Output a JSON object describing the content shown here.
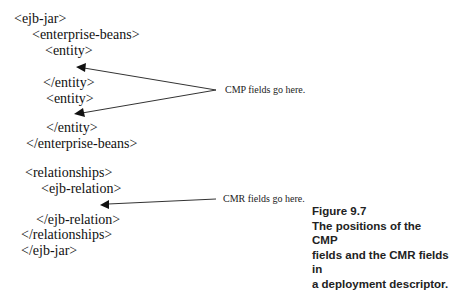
{
  "xml_lines": [
    {
      "text": "<ejb-jar>",
      "x": 14,
      "y": 12
    },
    {
      "text": "<enterprise-beans>",
      "x": 32,
      "y": 28
    },
    {
      "text": "<entity>",
      "x": 45,
      "y": 44
    },
    {
      "text": "</entity>",
      "x": 43,
      "y": 76
    },
    {
      "text": "<entity>",
      "x": 46,
      "y": 92
    },
    {
      "text": "</entity>",
      "x": 46,
      "y": 121
    },
    {
      "text": "</enterprise-beans>",
      "x": 26,
      "y": 137
    },
    {
      "text": "<relationships>",
      "x": 25,
      "y": 166
    },
    {
      "text": "<ejb-relation>",
      "x": 41,
      "y": 182
    },
    {
      "text": "</ejb-relation>",
      "x": 36,
      "y": 213
    },
    {
      "text": "</relationships>",
      "x": 21,
      "y": 228
    },
    {
      "text": "</ejb-jar>",
      "x": 21,
      "y": 244
    }
  ],
  "annotations": {
    "cmp": "CMP fields go here.",
    "cmr": "CMR fields go here."
  },
  "caption": {
    "label": "Figure 9.7",
    "line1": "The positions of the CMP",
    "line2": "fields and the CMR fields in",
    "line3": "a deployment descriptor."
  }
}
